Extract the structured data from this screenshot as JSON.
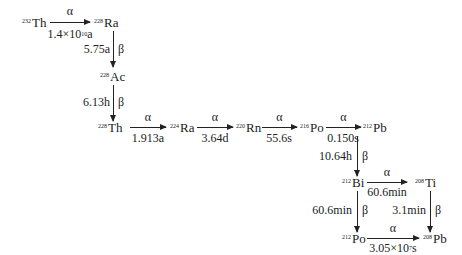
{
  "nuclides": {
    "th232": {
      "mass": "232",
      "symbol": "Th"
    },
    "ra228": {
      "mass": "228",
      "symbol": "Ra"
    },
    "ac228": {
      "mass": "228",
      "symbol": "Ac"
    },
    "th228": {
      "mass": "228",
      "symbol": "Th"
    },
    "ra224": {
      "mass": "224",
      "symbol": "Ra"
    },
    "rn220": {
      "mass": "220",
      "symbol": "Rn"
    },
    "po216": {
      "mass": "216",
      "symbol": "Po"
    },
    "pb212": {
      "mass": "212",
      "symbol": "Pb"
    },
    "bi212": {
      "mass": "212",
      "symbol": "Bi"
    },
    "tl208": {
      "mass": "208",
      "symbol": "Ti"
    },
    "po212": {
      "mass": "212",
      "symbol": "Po"
    },
    "pb208": {
      "mass": "208",
      "symbol": "Pb"
    }
  },
  "decays": {
    "th232_ra228": {
      "type": "α",
      "halflife_base": "1.4×10",
      "halflife_exp": "10",
      "halflife_unit": "a"
    },
    "ra228_ac228": {
      "type": "β",
      "halflife": "5.75a"
    },
    "ac228_th228": {
      "type": "β",
      "halflife": "6.13h"
    },
    "th228_ra224": {
      "type": "α",
      "halflife": "1.913a"
    },
    "ra224_rn220": {
      "type": "α",
      "halflife": "3.64d"
    },
    "rn220_po216": {
      "type": "α",
      "halflife": "55.6s"
    },
    "po216_pb212": {
      "type": "α",
      "halflife": "0.150s"
    },
    "pb212_bi212": {
      "type": "β",
      "halflife": "10.64h"
    },
    "bi212_tl208": {
      "type": "α",
      "halflife": "60.6min"
    },
    "bi212_po212": {
      "type": "β",
      "halflife": "60.6min"
    },
    "tl208_pb208": {
      "type": "β",
      "halflife": "3.1min"
    },
    "po212_pb208": {
      "type": "α",
      "halflife_base": "3.05×10",
      "halflife_exp": "7",
      "halflife_unit": "s"
    }
  }
}
